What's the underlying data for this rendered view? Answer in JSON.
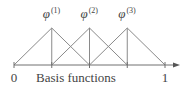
{
  "diagram": {
    "title": "Basis functions",
    "axis": {
      "start_label": "0",
      "end_label": "1",
      "nodes": [
        0,
        0.25,
        0.5,
        0.75,
        1
      ]
    },
    "functions": [
      {
        "symbol": "φ",
        "superscript": "(1)",
        "support": [
          0,
          0.5
        ],
        "peak": 0.25
      },
      {
        "symbol": "φ",
        "superscript": "(2)",
        "support": [
          0.25,
          0.75
        ],
        "peak": 0.5
      },
      {
        "symbol": "φ",
        "superscript": "(3)",
        "support": [
          0.5,
          1
        ],
        "peak": 0.75
      }
    ],
    "colors": {
      "line": "#8a8a8a",
      "text": "#444444"
    }
  }
}
